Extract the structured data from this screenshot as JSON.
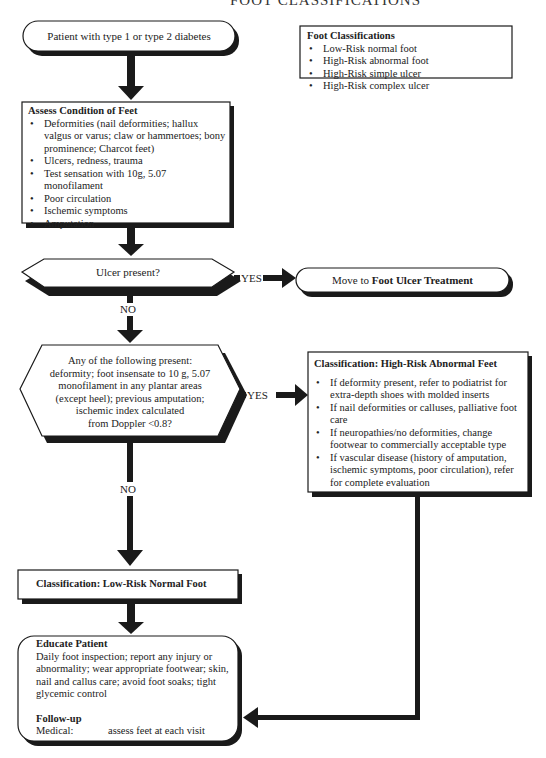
{
  "header": {
    "title_partial": "FOOT CLASSIFICATIONS"
  },
  "start": {
    "label": "Patient with type 1 or type 2 diabetes"
  },
  "legend": {
    "title": "Foot Classifications",
    "items": [
      "Low-Risk normal foot",
      "High-Risk abnormal foot",
      "High-Risk simple ulcer",
      "High-Risk complex ulcer"
    ]
  },
  "assess": {
    "title": "Assess Condition of Feet",
    "items": [
      "Deformities (nail deformities; hallux valgus or varus; claw or hammertoes; bony prominence; Charcot feet)",
      "Ulcers, redness, trauma",
      "Test sensation with 10g, 5.07 monofilament",
      "Poor circulation",
      "Ischemic symptoms",
      "Amputation"
    ]
  },
  "decision1": {
    "question": "Ulcer present?",
    "yes_label": "YES",
    "no_label": "NO"
  },
  "ulcer_treatment": {
    "prefix": "Move to",
    "target": "Foot Ulcer Treatment"
  },
  "decision2": {
    "question_lines": [
      "Any of the following present:",
      "deformity; foot insensate to 10 g, 5.07",
      "monofilament in any plantar areas",
      "(except heel); previous amputation;",
      "ischemic index calculated",
      "from Doppler <0.8?"
    ],
    "yes_label": "YES",
    "no_label": "NO"
  },
  "high_risk": {
    "title": "Classification: High-Risk Abnormal Feet",
    "items": [
      "If deformity present, refer to podiatrist for extra-depth shoes with molded inserts",
      "If nail deformities or calluses, palliative foot care",
      "If neuropathies/no deformities, change footwear to commercially acceptable type",
      "If vascular disease (history of amputation, ischemic symptoms, poor circulation), refer for complete evaluation"
    ]
  },
  "low_risk": {
    "title": "Classification: Low-Risk Normal Foot"
  },
  "educate": {
    "title": "Educate Patient",
    "body": "Daily foot inspection; report any injury or abnormality; wear appropriate footwear; skin, nail and callus care; avoid foot soaks; tight glycemic control",
    "followup_title": "Follow-up",
    "followup_label": "Medical:",
    "followup_value": "assess feet at each visit"
  },
  "colors": {
    "line": "#1a1a1a",
    "shadow": "#1a1a1a",
    "fill": "#ffffff",
    "text": "#222222"
  }
}
